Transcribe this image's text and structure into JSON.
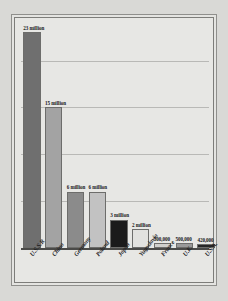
{
  "chart_data": {
    "type": "bar",
    "title": "",
    "subtitle": "",
    "xlabel": "",
    "ylabel": "",
    "categories": [
      "U.S.S.R",
      "China",
      "Germany",
      "Poland",
      "Japan",
      "Yugoslavia",
      "France",
      "U.K.",
      "U.S.A."
    ],
    "values": [
      23000000,
      15000000,
      6000000,
      6000000,
      3000000,
      2000000,
      500000,
      500000,
      420000
    ],
    "value_labels": [
      "23 million",
      "15 million",
      "6 million",
      "6 million",
      "3 million",
      "2 million",
      "500,000",
      "500,000",
      "420,000"
    ],
    "bar_colors": [
      "#6f6f6f",
      "#a3a3a3",
      "#8b8b8b",
      "#c2c2c2",
      "#1b1b1b",
      "#e2e2df",
      "#cfcfcc",
      "#9a9a9a",
      "#262626"
    ],
    "ylim": [
      0,
      24000000
    ],
    "grid": true,
    "gridlines": [
      5000000,
      10000000,
      15000000,
      20000000
    ],
    "legend": "none"
  },
  "frame": {
    "border_color": "#7d7d7a",
    "background": "#e7e7e4",
    "page_background": "#d9d9d6"
  }
}
